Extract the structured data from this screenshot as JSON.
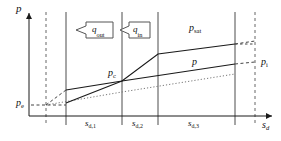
{
  "figure": {
    "type": "diagram",
    "background_color": "#ffffff",
    "line_color": "#1a1a1a",
    "dashed_color": "#4a4a4a",
    "dotted_color": "#6e6e6e"
  },
  "axes": {
    "y_label": "p",
    "x_label_main": "s",
    "x_label_sub": "d",
    "y_axis_name": "pressure-axis",
    "x_axis_name": "drainage-axis"
  },
  "labels": {
    "p_e": {
      "main": "p",
      "sub": "e"
    },
    "p_c": {
      "main": "p",
      "sub": "c"
    },
    "p_i": {
      "main": "p",
      "sub": "i"
    },
    "p_sat": {
      "main": "p",
      "sub": "sat"
    },
    "p_plain": {
      "main": "p",
      "sub": ""
    }
  },
  "flow_arrows": [
    {
      "name": "q-out-arrow",
      "main": "q",
      "sub": "out",
      "direction": "left"
    },
    {
      "name": "q-in-arrow",
      "main": "q",
      "sub": "in",
      "direction": "left"
    }
  ],
  "zones": [
    {
      "name": "zone-sd1",
      "main": "s",
      "sub": "d,1"
    },
    {
      "name": "zone-sd2",
      "main": "s",
      "sub": "d,2"
    },
    {
      "name": "zone-sd3",
      "main": "s",
      "sub": "d,3"
    }
  ]
}
